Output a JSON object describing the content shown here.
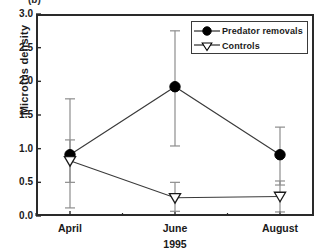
{
  "panel": {
    "label": "(b)"
  },
  "legend": {
    "entries": [
      {
        "label": "Predator removals",
        "marker": "filled-circle",
        "color": "#000000"
      },
      {
        "label": "Controls",
        "marker": "open-triangle-down",
        "color": "#000000"
      }
    ]
  },
  "axes": {
    "ylabel": "Microtus density",
    "xlabel": "1995",
    "yticks": [
      "0.0",
      "0.5",
      "1.0",
      "1.5",
      "2.0",
      "2.5",
      "3.0"
    ],
    "xticks": [
      "April",
      "June",
      "August"
    ]
  },
  "chart_data": {
    "type": "line",
    "title": "",
    "subtitle": "(b)",
    "xlabel": "1995",
    "ylabel": "Microtus density",
    "categories": [
      "April",
      "June",
      "August"
    ],
    "ylim": [
      0.0,
      3.0
    ],
    "ytick_step": 0.5,
    "grid": false,
    "legend_position": "top-right",
    "error_bars": "vertical-with-caps",
    "series": [
      {
        "name": "Predator removals",
        "marker": "filled-circle",
        "color": "#000000",
        "values": [
          0.91,
          1.92,
          0.91
        ],
        "err_low": [
          0.12,
          1.04,
          0.46
        ],
        "err_high": [
          1.74,
          2.75,
          1.32
        ]
      },
      {
        "name": "Controls",
        "marker": "open-triangle-down",
        "color": "#000000",
        "values": [
          0.82,
          0.27,
          0.29
        ],
        "err_low": [
          0.5,
          0.07,
          0.06
        ],
        "err_high": [
          1.13,
          0.5,
          0.52
        ]
      }
    ]
  }
}
